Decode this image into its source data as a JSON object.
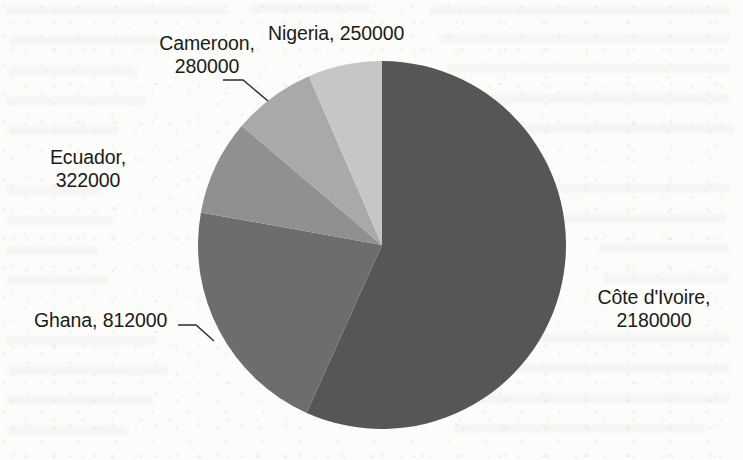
{
  "chart_data": {
    "type": "pie",
    "title": "",
    "subtitle": "",
    "xlabel": "",
    "ylabel": "",
    "legend_position": "none",
    "grid": false,
    "label_format": "category, value",
    "start_angle_deg": 90,
    "direction": "clockwise",
    "categories": [
      "Côte d'Ivoire",
      "Ghana",
      "Ecuador",
      "Cameroon",
      "Nigeria"
    ],
    "values": [
      2180000,
      812000,
      322000,
      280000,
      250000
    ],
    "total": 3844000,
    "slices": [
      {
        "name": "cote-divoire",
        "category": "Côte d'Ivoire",
        "value": 2180000,
        "value_text": "2180000",
        "percent": 56.7,
        "color": "#565656",
        "label_line1": "Côte d'Ivoire,",
        "label_line2": "2180000",
        "leader": false
      },
      {
        "name": "ghana",
        "category": "Ghana",
        "value": 812000,
        "value_text": "812000",
        "percent": 21.1,
        "color": "#6d6d6d",
        "label_line1": "Ghana, 812000",
        "label_line2": "",
        "leader": true
      },
      {
        "name": "ecuador",
        "category": "Ecuador",
        "value": 322000,
        "value_text": "322000",
        "percent": 8.4,
        "color": "#909090",
        "label_line1": "Ecuador,",
        "label_line2": "322000",
        "leader": false
      },
      {
        "name": "cameroon",
        "category": "Cameroon",
        "value": 280000,
        "value_text": "280000",
        "percent": 7.3,
        "color": "#a9a9a9",
        "label_line1": "Cameroon,",
        "label_line2": "280000",
        "leader": true
      },
      {
        "name": "nigeria",
        "category": "Nigeria",
        "value": 250000,
        "value_text": "250000",
        "percent": 6.5,
        "color": "#c6c6c6",
        "label_line1": "Nigeria, 250000",
        "label_line2": "",
        "leader": false
      }
    ]
  },
  "labels": {
    "nigeria": "Nigeria, 250000",
    "cameroon_line1": "Cameroon,",
    "cameroon_line2": "280000",
    "ecuador_line1": "Ecuador,",
    "ecuador_line2": "322000",
    "ghana": "Ghana, 812000",
    "cotedivoire_line1": "Côte d'Ivoire,",
    "cotedivoire_line2": "2180000"
  },
  "geometry": {
    "center_x": 382,
    "center_y": 245,
    "radius": 184
  }
}
